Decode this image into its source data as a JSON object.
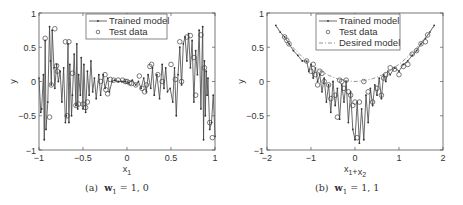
{
  "figures": [
    {
      "id": "a",
      "caption_prefix": "(a)",
      "caption_math": "w",
      "caption_sub": "1",
      "caption_rest": " = 1, 0",
      "xlabel": "x",
      "xlabel_sub": "1",
      "ylabel": "y"
    },
    {
      "id": "b",
      "caption_prefix": "(b)",
      "caption_math": "w",
      "caption_sub": "1",
      "caption_rest": " = 1, 1",
      "xlabel": "x",
      "xlabel_sub": "1",
      "xlabel_plus": "+x",
      "xlabel_sub2": "2",
      "ylabel": "y"
    }
  ],
  "chart_data": [
    {
      "type": "line",
      "title": "",
      "caption": "(a) w1 = 1,0",
      "xlabel": "x1",
      "ylabel": "y",
      "xlim": [
        -1,
        1
      ],
      "ylim": [
        -1,
        1
      ],
      "xticks": [
        "-1",
        "-0.5",
        "0",
        "0.5",
        "1"
      ],
      "yticks": [
        "-1",
        "-0.5",
        "0",
        "0.5",
        "1"
      ],
      "grid": false,
      "legend": {
        "position": "upper center",
        "entries": [
          "Trained model",
          "Test data"
        ]
      },
      "series": [
        {
          "name": "Trained model",
          "style": "line with dot markers",
          "x": [
            -1.0,
            -0.98,
            -0.97,
            -0.95,
            -0.94,
            -0.93,
            -0.92,
            -0.9,
            -0.88,
            -0.87,
            -0.86,
            -0.85,
            -0.83,
            -0.82,
            -0.8,
            -0.78,
            -0.76,
            -0.74,
            -0.72,
            -0.7,
            -0.69,
            -0.67,
            -0.66,
            -0.65,
            -0.63,
            -0.62,
            -0.6,
            -0.58,
            -0.57,
            -0.56,
            -0.55,
            -0.53,
            -0.52,
            -0.5,
            -0.49,
            -0.47,
            -0.45,
            -0.43,
            -0.41,
            -0.39,
            -0.37,
            -0.35,
            -0.32,
            -0.3,
            -0.27,
            -0.25,
            -0.22,
            -0.2,
            -0.17,
            -0.14,
            -0.1,
            -0.06,
            -0.02,
            0.02,
            0.06,
            0.1,
            0.13,
            0.16,
            0.19,
            0.22,
            0.24,
            0.27,
            0.29,
            0.31,
            0.34,
            0.37,
            0.4,
            0.42,
            0.44,
            0.46,
            0.49,
            0.52,
            0.54,
            0.56,
            0.58,
            0.6,
            0.62,
            0.64,
            0.66,
            0.68,
            0.7,
            0.72,
            0.74,
            0.76,
            0.78,
            0.8,
            0.82,
            0.84,
            0.86,
            0.87,
            0.88,
            0.89,
            0.9,
            0.91,
            0.92,
            0.94,
            0.96,
            0.98,
            1.0
          ],
          "y": [
            0.05,
            -0.45,
            -0.4,
            0.1,
            -0.85,
            0.6,
            -0.7,
            -0.3,
            0.8,
            0.3,
            -0.05,
            0.75,
            0.2,
            -0.1,
            0.25,
            0.0,
            0.15,
            -0.3,
            0.2,
            -0.6,
            -0.5,
            0.55,
            -0.6,
            0.25,
            -0.5,
            -0.2,
            0.4,
            -0.35,
            0.55,
            -0.4,
            0.1,
            -0.2,
            0.35,
            -0.4,
            0.25,
            -0.45,
            0.15,
            -0.2,
            0.3,
            -0.15,
            0.05,
            -0.25,
            0.1,
            -0.2,
            0.1,
            -0.1,
            0.05,
            -0.15,
            0.0,
            0.02,
            0.0,
            0.0,
            0.0,
            -0.02,
            0.02,
            -0.05,
            0.0,
            -0.1,
            0.05,
            -0.15,
            0.1,
            -0.1,
            0.2,
            -0.2,
            0.1,
            -0.25,
            0.25,
            -0.1,
            0.2,
            -0.15,
            -0.1,
            -0.3,
            0.2,
            -0.5,
            0.1,
            0.5,
            -0.05,
            0.55,
            0.65,
            0.3,
            0.7,
            0.2,
            0.6,
            -0.3,
            0.45,
            0.1,
            0.75,
            -0.4,
            0.8,
            -0.85,
            0.3,
            -0.5,
            0.15,
            -0.2,
            0.05,
            -0.7,
            -0.6,
            -0.2,
            -0.8
          ]
        },
        {
          "name": "Test data",
          "style": "open circle markers",
          "x": [
            -0.93,
            -0.88,
            -0.86,
            -0.82,
            -0.8,
            -0.79,
            -0.7,
            -0.68,
            -0.66,
            -0.62,
            -0.58,
            -0.55,
            -0.5,
            -0.47,
            -0.45,
            -0.3,
            -0.25,
            -0.24,
            -0.22,
            -0.19,
            -0.15,
            -0.1,
            -0.05,
            -0.02,
            0.0,
            0.03,
            0.05,
            0.1,
            0.14,
            0.17,
            0.2,
            0.22,
            0.26,
            0.28,
            0.35,
            0.4,
            0.5,
            0.55,
            0.6,
            0.62,
            0.68,
            0.72,
            0.76,
            0.78,
            0.84,
            0.88,
            0.94,
            0.97
          ],
          "y": [
            0.63,
            -0.52,
            -0.05,
            0.77,
            0.23,
            0.15,
            0.58,
            -0.5,
            0.58,
            0.12,
            -0.35,
            -0.33,
            -0.33,
            -0.38,
            -0.3,
            0.0,
            0.1,
            -0.12,
            -0.18,
            0.03,
            0.02,
            0.02,
            0.02,
            0.0,
            0.0,
            -0.02,
            -0.03,
            -0.05,
            0.08,
            -0.1,
            -0.15,
            -0.05,
            0.22,
            0.25,
            0.1,
            0.0,
            0.25,
            0.03,
            0.58,
            0.0,
            0.65,
            0.67,
            0.35,
            -0.2,
            0.68,
            0.2,
            -0.6,
            -0.82
          ]
        }
      ]
    },
    {
      "type": "line",
      "title": "",
      "caption": "(b) w1 = 1,1",
      "xlabel": "x1+x2",
      "ylabel": "y",
      "xlim": [
        -2,
        2
      ],
      "ylim": [
        -1,
        1
      ],
      "xticks": [
        "-2",
        "-1",
        "0",
        "1",
        "2"
      ],
      "yticks": [
        "-1",
        "-0.5",
        "0",
        "0.5",
        "1"
      ],
      "grid": false,
      "legend": {
        "position": "upper center",
        "entries": [
          "Trained model",
          "Test data",
          "Desired model"
        ]
      },
      "series": [
        {
          "name": "Trained model",
          "style": "line with dot markers",
          "x": [
            -1.8,
            -1.7,
            -1.6,
            -1.5,
            -1.4,
            -1.3,
            -1.2,
            -1.1,
            -1.05,
            -1.0,
            -0.95,
            -0.9,
            -0.85,
            -0.8,
            -0.75,
            -0.7,
            -0.65,
            -0.6,
            -0.55,
            -0.5,
            -0.45,
            -0.4,
            -0.35,
            -0.3,
            -0.25,
            -0.2,
            -0.15,
            -0.1,
            -0.05,
            0.0,
            0.05,
            0.1,
            0.15,
            0.2,
            0.25,
            0.3,
            0.35,
            0.4,
            0.45,
            0.5,
            0.55,
            0.6,
            0.65,
            0.7,
            0.75,
            0.8,
            0.9,
            1.0,
            1.1,
            1.2,
            1.3,
            1.4,
            1.5,
            1.6,
            1.7,
            1.8
          ],
          "y": [
            0.82,
            0.72,
            0.65,
            0.55,
            0.45,
            0.38,
            0.3,
            0.3,
            0.15,
            0.25,
            0.05,
            0.2,
            0.0,
            0.1,
            -0.15,
            0.05,
            -0.3,
            -0.05,
            -0.45,
            0.0,
            -0.35,
            -0.1,
            -0.55,
            -0.05,
            -0.3,
            0.0,
            -0.6,
            -0.15,
            -0.7,
            -0.85,
            -0.3,
            -0.9,
            -0.4,
            -0.85,
            -0.2,
            -0.6,
            -0.1,
            -0.35,
            -0.05,
            -0.2,
            0.05,
            -0.25,
            0.1,
            0.0,
            0.15,
            0.1,
            0.2,
            0.15,
            0.25,
            0.3,
            0.38,
            0.45,
            0.55,
            0.63,
            0.72,
            0.82
          ]
        },
        {
          "name": "Test data",
          "style": "open circle markers",
          "x": [
            -1.6,
            -1.55,
            -1.5,
            -1.1,
            -1.0,
            -0.95,
            -0.9,
            -0.85,
            -0.8,
            -0.75,
            -0.7,
            -0.6,
            -0.55,
            -0.45,
            -0.4,
            -0.35,
            -0.3,
            -0.25,
            -0.2,
            -0.15,
            -0.1,
            -0.05,
            0.0,
            0.05,
            0.1,
            0.2,
            0.3,
            0.4,
            0.5,
            0.6,
            0.65,
            0.7,
            0.8,
            0.9,
            1.0,
            1.1,
            1.2,
            1.3,
            1.4,
            1.5,
            1.6,
            1.65
          ],
          "y": [
            0.65,
            0.6,
            0.55,
            0.3,
            0.15,
            0.25,
            0.1,
            -0.05,
            0.15,
            0.12,
            0.0,
            -0.05,
            -0.25,
            -0.2,
            -0.52,
            0.02,
            0.0,
            -0.1,
            0.02,
            -0.15,
            -0.2,
            -0.35,
            -0.3,
            -0.82,
            -0.3,
            0.0,
            -0.15,
            -0.3,
            -0.1,
            -0.2,
            0.05,
            0.1,
            0.2,
            0.18,
            0.1,
            0.22,
            0.25,
            0.4,
            0.45,
            0.55,
            0.58,
            0.68
          ]
        },
        {
          "name": "Desired model",
          "style": "dash-dot line",
          "x": [
            -1.8,
            -1.6,
            -1.4,
            -1.2,
            -1.0,
            -0.8,
            -0.6,
            -0.4,
            -0.2,
            0.0,
            0.2,
            0.4,
            0.6,
            0.8,
            1.0,
            1.2,
            1.4,
            1.6,
            1.8
          ],
          "y": [
            0.81,
            0.64,
            0.49,
            0.36,
            0.25,
            0.16,
            0.09,
            0.04,
            0.01,
            0.0,
            0.01,
            0.04,
            0.09,
            0.16,
            0.25,
            0.36,
            0.49,
            0.64,
            0.81
          ]
        }
      ]
    }
  ]
}
